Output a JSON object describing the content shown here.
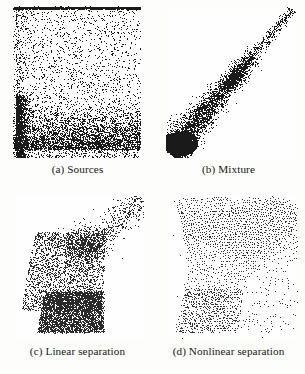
{
  "figure": {
    "background_color": "#fdfdfc",
    "ink_color": "#1a1a1a",
    "panel_count": 4,
    "layout": "2x2 grid of scatter plots with lettered captions below each panel"
  },
  "panels": [
    {
      "id": "a",
      "caption": "(a) Sources",
      "position": "top-left"
    },
    {
      "id": "b",
      "caption": "(b) Mixture",
      "position": "top-right"
    },
    {
      "id": "c",
      "caption": "(c) Linear separation",
      "position": "bottom-left"
    },
    {
      "id": "d",
      "caption": "(d) Nonlinear separation",
      "position": "bottom-right"
    }
  ],
  "chart_data": [
    {
      "type": "scatter",
      "panel": "a",
      "title": "(a) Sources",
      "xlabel": "",
      "ylabel": "",
      "xlim": [
        0,
        1
      ],
      "ylim": [
        0,
        1
      ],
      "grid": false,
      "legend": "none",
      "marker": "dot",
      "marker_color": "#1a1a1a",
      "n_points": 4200,
      "description": "Approximately uniform scatter filling the square, with strongly elevated point density forming a dark horizontal band along the lower portion and a dark vertical band along the left edge; a thin dark rule runs along the very top edge.",
      "density_model": {
        "base": "uniform over unit square",
        "bands": [
          {
            "axis": "y",
            "center": 0.16,
            "halfwidth": 0.16,
            "extra_weight": 2.6
          },
          {
            "axis": "x",
            "center": 0.02,
            "halfwidth": 0.05,
            "extra_weight": 3.2
          }
        ],
        "top_rule": {
          "y": 0.995,
          "thickness": 0.012,
          "weight": 6.0
        }
      }
    },
    {
      "type": "scatter",
      "panel": "b",
      "title": "(b) Mixture",
      "xlabel": "",
      "ylabel": "",
      "xlim": [
        0,
        1
      ],
      "ylim": [
        0,
        1
      ],
      "grid": false,
      "legend": "none",
      "marker": "dot",
      "marker_color": "#1a1a1a",
      "n_points": 4200,
      "description": "Strongly correlated elongated cloud oriented along the bottom-left to top-right diagonal; a very dense near-black blob sits at the lower-left end and the cloud thins progressively toward the upper-right tip.",
      "density_model": {
        "axis_start": [
          0.03,
          0.04
        ],
        "axis_end": [
          0.96,
          0.98
        ],
        "width_start": 0.14,
        "width_end": 0.035,
        "along_axis_density": "decays toward upper-right",
        "core_blob": {
          "t": 0.06,
          "radius": 0.1,
          "weight": 7.0
        }
      }
    },
    {
      "type": "scatter",
      "panel": "c",
      "title": "(c) Linear separation",
      "xlabel": "",
      "ylabel": "",
      "xlim": [
        0,
        1
      ],
      "ylim": [
        0,
        1
      ],
      "grid": false,
      "legend": "none",
      "marker": "dot",
      "marker_color": "#2a2a2a",
      "n_points": 4000,
      "description": "Fan or wedge shaped cloud: a solid dense quadrilateral block occupies the lower-left to lower-centre region, a diffuse medium-density body rises above it, and a sparse tail streams out toward the upper-right corner.",
      "density_model": {
        "block": {
          "x": [
            0.22,
            0.66
          ],
          "y": [
            0.05,
            0.33
          ],
          "weight": 5.0,
          "regular": true
        },
        "body": {
          "x": [
            0.06,
            0.7
          ],
          "y": [
            0.2,
            0.75
          ],
          "weight": 2.0
        },
        "tail": {
          "from": [
            0.55,
            0.62
          ],
          "to": [
            0.99,
            0.99
          ],
          "width": 0.13,
          "weight": 0.5
        }
      }
    },
    {
      "type": "scatter",
      "panel": "d",
      "title": "(d) Nonlinear separation",
      "xlabel": "",
      "ylabel": "",
      "xlim": [
        0,
        1
      ],
      "ylim": [
        0,
        1
      ],
      "grid": false,
      "legend": "none",
      "marker": "dot",
      "marker_color": "#343434",
      "n_points": 4400,
      "description": "Roughly square cloud of points arranged on a warped quasi-regular lattice, producing visible diagonal moire striations; density is heavier across the upper band and in a lattice patch at the lower-left, lighter along the right edge.",
      "density_model": {
        "lattice": {
          "nx": 52,
          "ny": 52,
          "jitter": 0.35,
          "warp": "mild shear and barrel warp"
        },
        "region": {
          "x": [
            0.03,
            0.95
          ],
          "y": [
            0.03,
            0.97
          ]
        },
        "heavier_bands": [
          {
            "axis": "y",
            "center": 0.8,
            "halfwidth": 0.18,
            "extra_weight": 1.6
          },
          {
            "axis": "xy-diagonal",
            "extra_weight": 1.2
          }
        ]
      }
    }
  ]
}
